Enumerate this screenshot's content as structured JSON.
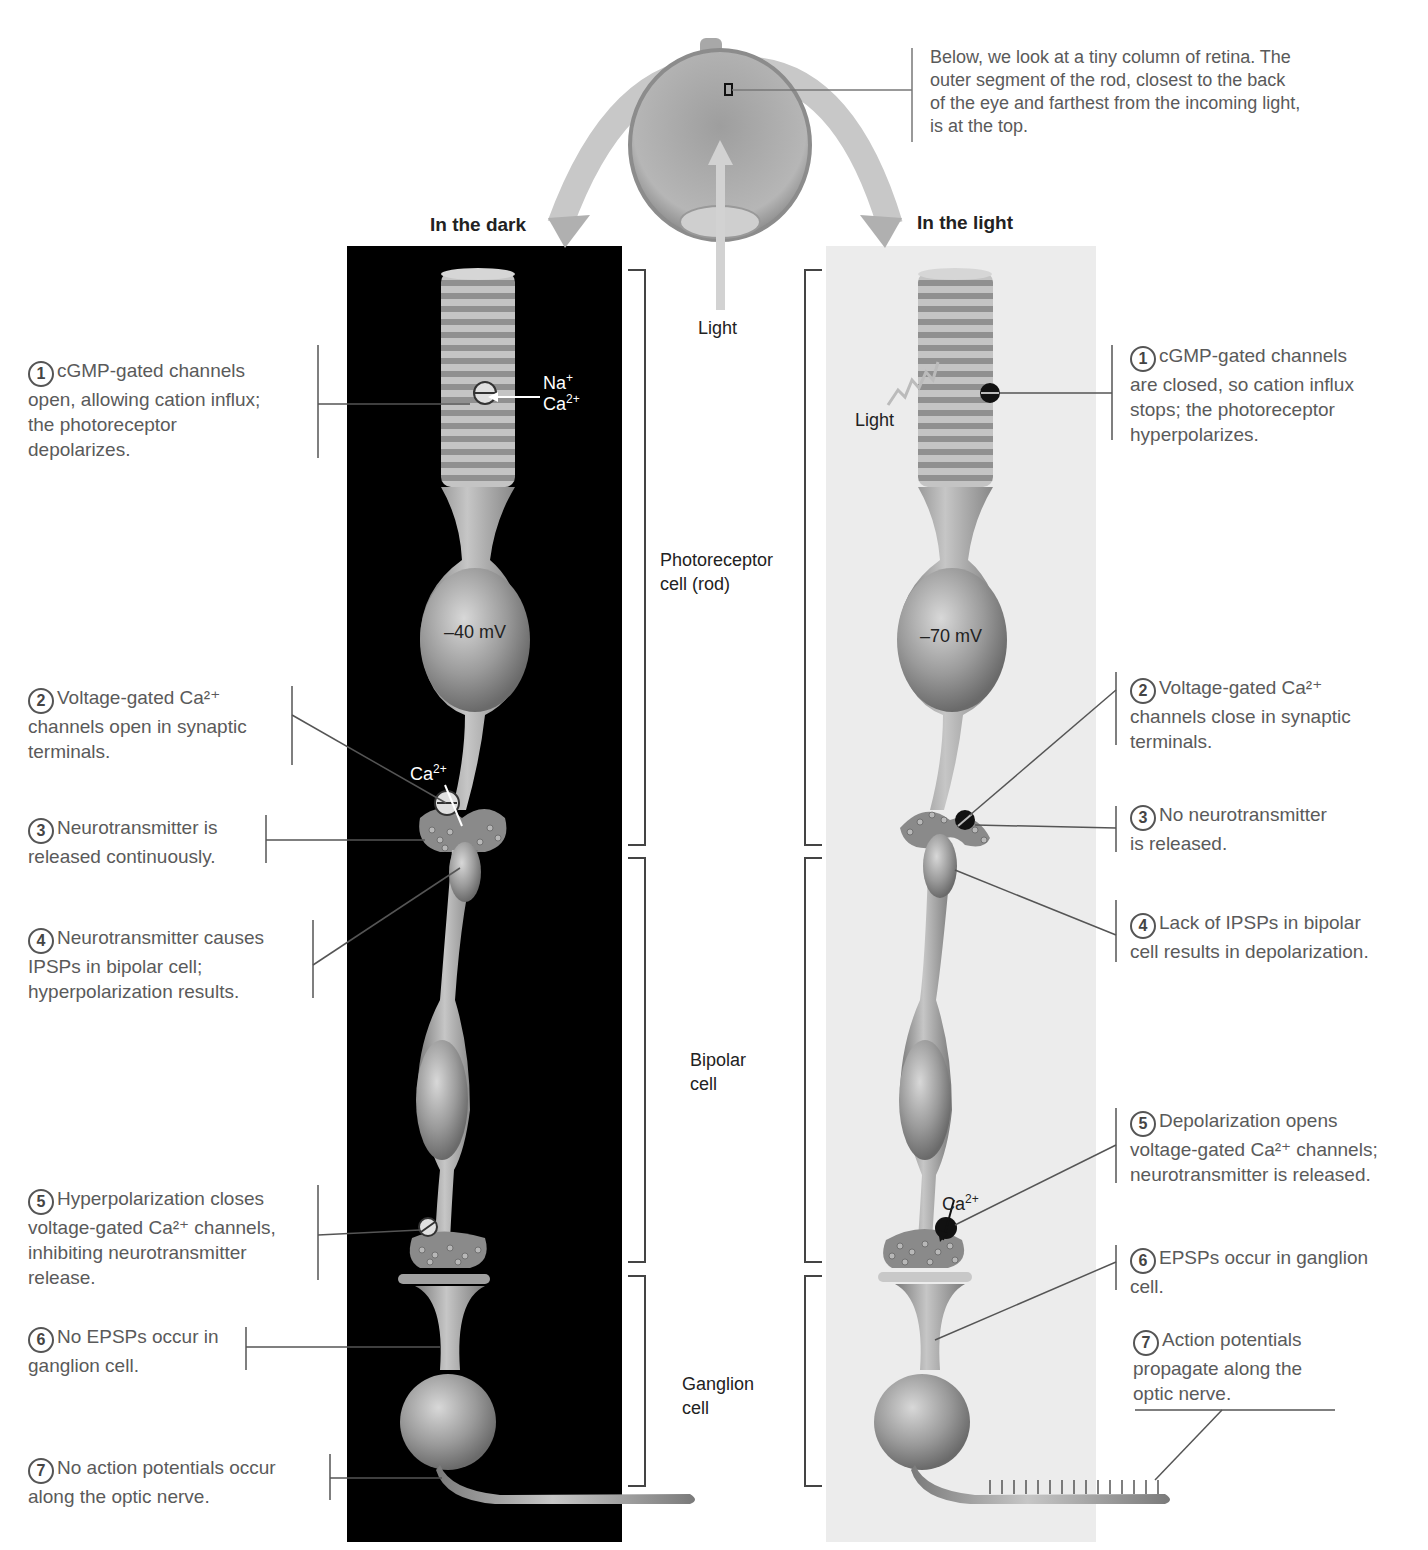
{
  "eye_note": {
    "lines": [
      "Below, we look at a tiny column of retina.  The",
      "outer segment of the rod, closest to the back",
      "of the eye and farthest from the incoming light,",
      "is at the top."
    ]
  },
  "center": {
    "light_label": "Light",
    "brackets": {
      "photoreceptor": [
        "Photoreceptor",
        "cell (rod)"
      ],
      "bipolar": [
        "Bipolar",
        "cell"
      ],
      "ganglion": [
        "Ganglion",
        "cell"
      ]
    }
  },
  "dark": {
    "title": "In the dark",
    "ion_labels": {
      "na": "Na",
      "na_sup": "+",
      "ca": "Ca",
      "ca_sup": "2+",
      "ca_syn": "Ca",
      "ca_syn_sup": "2+"
    },
    "voltage": "–40 mV",
    "steps": [
      {
        "num": "1",
        "lines": [
          "cGMP-gated channels",
          "open, allowing cation influx;",
          "the photoreceptor",
          "depolarizes."
        ]
      },
      {
        "num": "2",
        "lines": [
          "Voltage-gated Ca²⁺",
          "channels open in synaptic",
          "terminals."
        ]
      },
      {
        "num": "3",
        "lines": [
          "Neurotransmitter is",
          "released continuously."
        ]
      },
      {
        "num": "4",
        "lines": [
          "Neurotransmitter causes",
          "IPSPs in bipolar cell;",
          "hyperpolarization results."
        ]
      },
      {
        "num": "5",
        "lines": [
          "Hyperpolarization closes",
          "voltage-gated Ca²⁺ channels,",
          "inhibiting neurotransmitter",
          "release."
        ]
      },
      {
        "num": "6",
        "lines": [
          "No EPSPs occur in",
          "ganglion cell."
        ]
      },
      {
        "num": "7",
        "lines": [
          "No action potentials occur",
          "along the optic nerve."
        ]
      }
    ]
  },
  "light": {
    "title": "In the light",
    "light_label": "Light",
    "ca_label": "Ca",
    "ca_sup": "2+",
    "voltage": "–70 mV",
    "steps": [
      {
        "num": "1",
        "lines": [
          "cGMP-gated channels",
          "are closed, so cation influx",
          "stops; the photoreceptor",
          "hyperpolarizes."
        ]
      },
      {
        "num": "2",
        "lines": [
          "Voltage-gated Ca²⁺",
          "channels close in synaptic",
          "terminals."
        ]
      },
      {
        "num": "3",
        "lines": [
          "No neurotransmitter",
          "is released."
        ]
      },
      {
        "num": "4",
        "lines": [
          "Lack of IPSPs in bipolar",
          "cell results in depolarization."
        ]
      },
      {
        "num": "5",
        "lines": [
          "Depolarization opens",
          "voltage-gated Ca²⁺ channels;",
          "neurotransmitter is released."
        ]
      },
      {
        "num": "6",
        "lines": [
          "EPSPs occur in ganglion",
          "cell."
        ]
      },
      {
        "num": "7",
        "lines": [
          "Action potentials",
          "propagate along the",
          "optic nerve."
        ]
      }
    ]
  },
  "colors": {
    "dark_panel": "#000000",
    "light_panel": "#eeeeee",
    "cell_fill": "#a8a8a8",
    "cell_shadow": "#6e6e6e",
    "text": "#5a5a5a",
    "bracket": "#444444"
  }
}
